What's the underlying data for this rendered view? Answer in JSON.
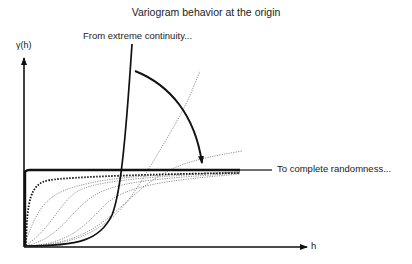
{
  "title": "Variogram behavior at the origin",
  "annotations": {
    "top": "From extreme continuity...",
    "right": "To complete randomness..."
  },
  "axes": {
    "y_label": "γ(h)",
    "x_label": "h"
  },
  "curves": [
    {
      "name": "extreme-continuity",
      "style": "solid-thick"
    },
    {
      "name": "pure-nugget",
      "style": "solid-thick"
    },
    {
      "name": "near-nugget",
      "style": "dotted-thick"
    },
    {
      "name": "gaussian-series",
      "style": "dotted-thin"
    }
  ],
  "colors": {
    "ink": "#111111",
    "thin": "#777777"
  }
}
